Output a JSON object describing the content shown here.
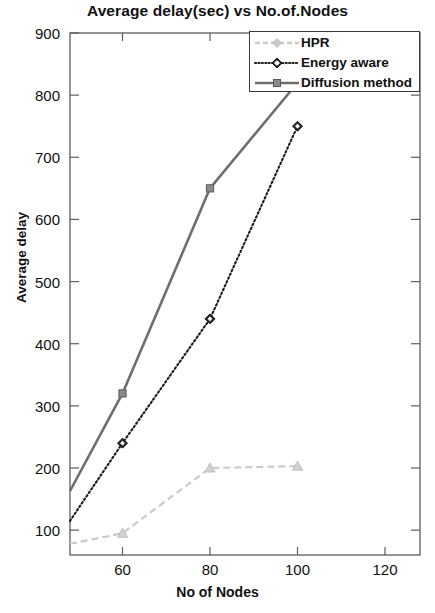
{
  "chart_data": {
    "type": "line",
    "title": "Average delay(sec) vs No.of.Nodes",
    "xlabel": "No of Nodes",
    "ylabel": "Average delay",
    "xlim": [
      48,
      128
    ],
    "ylim": [
      60,
      900
    ],
    "xticks": [
      60,
      80,
      100,
      120
    ],
    "yticks": [
      100,
      200,
      300,
      400,
      500,
      600,
      700,
      800,
      900
    ],
    "grid": false,
    "legend_position": "top-right",
    "series": [
      {
        "name": "HPR",
        "color": "#c9c9c9",
        "linestyle": "dashed",
        "marker": "triangle",
        "x": [
          48,
          60,
          80,
          100
        ],
        "values": [
          78,
          95,
          200,
          203
        ]
      },
      {
        "name": "Energy aware",
        "color": "#1c1c1c",
        "linestyle": "dotted",
        "marker": "diamond",
        "x": [
          48,
          60,
          80,
          100
        ],
        "values": [
          115,
          240,
          440,
          750
        ]
      },
      {
        "name": "Diffusion method",
        "color": "#6e6e6e",
        "linestyle": "solid",
        "marker": "square",
        "x": [
          48,
          60,
          80,
          100
        ],
        "values": [
          163,
          320,
          650,
          820
        ]
      }
    ]
  },
  "legend": {
    "items": [
      {
        "label": "HPR"
      },
      {
        "label": "Energy aware"
      },
      {
        "label": "Diffusion method"
      }
    ]
  },
  "axis": {
    "ytick_labels": [
      "900",
      "800",
      "700",
      "600",
      "500",
      "400",
      "300",
      "200",
      "100"
    ],
    "xtick_labels": [
      "60",
      "80",
      "100",
      "120"
    ]
  }
}
